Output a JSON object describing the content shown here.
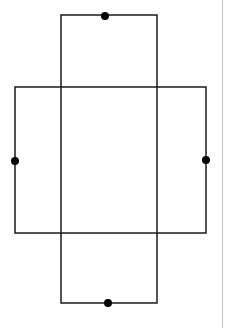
{
  "diagram": {
    "type": "overlapping-rectangles",
    "colors": {
      "stroke": "#1a1a1a",
      "dot": "#000000",
      "background": "#ffffff",
      "divider": "#c8c8c8"
    },
    "rectangles": [
      {
        "id": "vertical",
        "x": 61,
        "y": 15,
        "width": 96,
        "height": 288
      },
      {
        "id": "horizontal",
        "x": 15,
        "y": 87,
        "width": 191,
        "height": 146
      }
    ],
    "dots": [
      {
        "id": "top",
        "cx": 105,
        "cy": 16,
        "r": 4
      },
      {
        "id": "bottom",
        "cx": 108,
        "cy": 303,
        "r": 4
      },
      {
        "id": "left",
        "cx": 15,
        "cy": 161,
        "r": 4
      },
      {
        "id": "right",
        "cx": 206,
        "cy": 160,
        "r": 4
      }
    ]
  }
}
